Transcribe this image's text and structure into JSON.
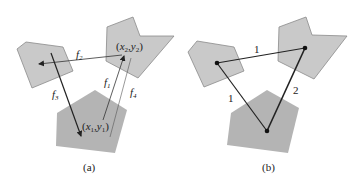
{
  "panel_a": {
    "caption": "(a)",
    "point_1_label": "(x1,y1)",
    "point_2_label": "(x2,y2)",
    "arrows": [
      {
        "name": "f1",
        "label": "f1"
      },
      {
        "name": "f2",
        "label": "f2"
      },
      {
        "name": "f3",
        "label": "f3"
      },
      {
        "name": "f4",
        "label": "f4"
      }
    ]
  },
  "panel_b": {
    "caption": "(b)",
    "edges": [
      {
        "from": "left",
        "to": "top-right",
        "weight": "1"
      },
      {
        "from": "left",
        "to": "bottom",
        "weight": "1"
      },
      {
        "from": "bottom",
        "to": "top-right",
        "weight": "2"
      }
    ]
  },
  "colors": {
    "region_light": "#c9c9c9",
    "region_dark": "#b4b4b4",
    "line": "#222222"
  }
}
